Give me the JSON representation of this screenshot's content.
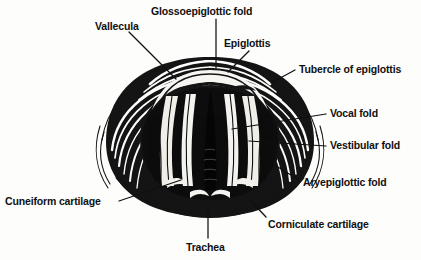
{
  "figure": {
    "style": "black-and-white engraving / woodcut line illustration",
    "background_color": "#fdfdfb",
    "ink_color": "#101010",
    "illustration_bounds": {
      "x": 100,
      "y": 58,
      "width": 220,
      "height": 158
    }
  },
  "labels": [
    {
      "id": "vallecula",
      "text": "Vallecula",
      "text_x": 95,
      "text_y": 21,
      "leader": {
        "x1": 129,
        "y1": 32,
        "x2": 176,
        "y2": 79
      }
    },
    {
      "id": "glossoepiglottic-fold",
      "text": "Glossoepiglottic fold",
      "text_x": 151,
      "text_y": 6,
      "leader": {
        "x1": 216,
        "y1": 19,
        "x2": 216,
        "y2": 68
      }
    },
    {
      "id": "epiglottis",
      "text": "Epiglottis",
      "text_x": 224,
      "text_y": 38,
      "leader": {
        "x1": 249,
        "y1": 51,
        "x2": 228,
        "y2": 72
      }
    },
    {
      "id": "tubercle-of-epiglottis",
      "text": "Tubercle of epiglottis",
      "text_x": 299,
      "text_y": 64,
      "leader": {
        "x1": 295,
        "y1": 70,
        "x2": 271,
        "y2": 83
      }
    },
    {
      "id": "vocal-fold",
      "text": "Vocal fold",
      "text_x": 330,
      "text_y": 108,
      "leader": {
        "x1": 326,
        "y1": 114,
        "x2": 232,
        "y2": 129
      }
    },
    {
      "id": "vestibular-fold",
      "text": "Vestibular fold",
      "text_x": 330,
      "text_y": 140,
      "leader": {
        "x1": 326,
        "y1": 146,
        "x2": 249,
        "y2": 141
      }
    },
    {
      "id": "aryepiglottic-fold",
      "text": "Aryepiglottic fold",
      "text_x": 303,
      "text_y": 177,
      "leader": {
        "x1": 299,
        "y1": 180,
        "x2": 273,
        "y2": 164
      }
    },
    {
      "id": "corniculate-cartilage",
      "text": "Corniculate cartilage",
      "text_x": 268,
      "text_y": 219,
      "leader": {
        "x1": 266,
        "y1": 217,
        "x2": 249,
        "y2": 199
      }
    },
    {
      "id": "cuneiform-cartilage",
      "text": "Cuneiform cartilage",
      "text_x": 5,
      "text_y": 196,
      "leader": {
        "x1": 119,
        "y1": 201,
        "x2": 181,
        "y2": 180
      }
    },
    {
      "id": "trachea",
      "text": "Trachea",
      "text_x": 186,
      "text_y": 242,
      "leader": {
        "x1": 208,
        "y1": 205,
        "x2": 208,
        "y2": 238
      }
    }
  ],
  "structures": [
    {
      "id": "epiglottis-arch",
      "name": "Epiglottis",
      "description": "large curved flap forming the upper rim of the inlet"
    },
    {
      "id": "glottic-opening",
      "name": "Rima glottidis",
      "description": "dark central triangular airway opening"
    },
    {
      "id": "vocal-folds",
      "name": "Vocal folds",
      "description": "pale bands bordering the glottic opening"
    },
    {
      "id": "vestibular-folds",
      "name": "Vestibular folds",
      "description": "pale bands lateral to the vocal folds"
    },
    {
      "id": "aryepiglottic-folds",
      "name": "Aryepiglottic folds",
      "description": "lateral margins sweeping down to the arytenoids"
    },
    {
      "id": "cuneiform-tubercles",
      "name": "Cuneiform cartilages",
      "description": "paired pale nodules on the lower lateral margin"
    },
    {
      "id": "corniculate-tubercles",
      "name": "Corniculate cartilages",
      "description": "paired pale nodules at the posterior rim"
    }
  ]
}
